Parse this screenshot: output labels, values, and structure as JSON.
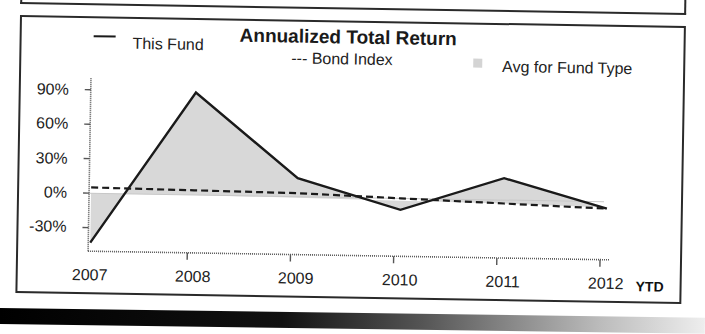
{
  "chart_data": {
    "type": "line",
    "title": "Annualized Total Return",
    "xlabel": "",
    "ylabel": "",
    "categories": [
      "2007",
      "2008",
      "2009",
      "2010",
      "2011",
      "2012"
    ],
    "x_suffix": "YTD",
    "ylim": [
      -45,
      100
    ],
    "yticks": [
      90,
      60,
      30,
      0,
      -30
    ],
    "ytick_labels": [
      "90%",
      "60%",
      "30%",
      "0%",
      "-30%"
    ],
    "grid": false,
    "legend_position": "top",
    "series": [
      {
        "name": "This Fund",
        "style": "solid",
        "values": [
          -43,
          89,
          16,
          -10,
          19,
          -6
        ]
      },
      {
        "name": "Bond Index",
        "style": "dashed",
        "values": [
          5,
          4,
          3,
          0,
          -3,
          -6
        ]
      },
      {
        "name": "Avg for Fund Type",
        "style": "area",
        "values": [
          0,
          0,
          -1,
          -2,
          -3,
          -5
        ]
      }
    ]
  },
  "legend": {
    "this_fund": "This Fund",
    "bond_index": "--- Bond Index",
    "avg_fund_type": "Avg for Fund Type"
  },
  "x_axis": {
    "labels": [
      "2007",
      "2008",
      "2009",
      "2010",
      "2011",
      "2012"
    ],
    "suffix": "YTD"
  },
  "y_axis": {
    "labels": [
      "90%",
      "60%",
      "30%",
      "0%",
      "-30%"
    ]
  },
  "colors": {
    "fund_line": "#1a1a1a",
    "bond_line": "#1a1a1a",
    "avg_fill": "#d8d8d8",
    "border": "#2a2a2a"
  }
}
